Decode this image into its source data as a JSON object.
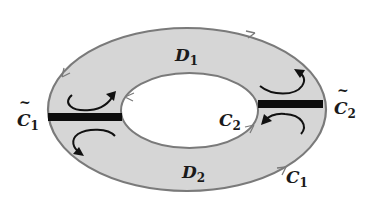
{
  "diagram": {
    "type": "annulus-region-decomposition",
    "colors": {
      "region_fill": "#d6d6d6",
      "boundary_stroke": "#7a7a7a",
      "cut_bar": "#0d0d0d",
      "arrow": "#111111",
      "background": "#ffffff"
    },
    "regions": [
      {
        "name": "D",
        "sub": "1",
        "position": "upper half of annulus"
      },
      {
        "name": "D",
        "sub": "2",
        "position": "lower half of annulus"
      }
    ],
    "curves": [
      {
        "name": "C",
        "sub": "1",
        "tilde": false,
        "role": "outer boundary"
      },
      {
        "name": "C",
        "sub": "2",
        "tilde": false,
        "role": "inner boundary"
      },
      {
        "name": "C",
        "sub": "1",
        "tilde": true,
        "role": "left cut"
      },
      {
        "name": "C",
        "sub": "2",
        "tilde": true,
        "role": "right cut"
      }
    ],
    "labels": {
      "d1": {
        "main": "D",
        "sub": "1"
      },
      "d2": {
        "main": "D",
        "sub": "2"
      },
      "c1": {
        "main": "C",
        "sub": "1"
      },
      "c2": {
        "main": "C",
        "sub": "2"
      },
      "c1_tilde": {
        "main": "C",
        "sub": "1",
        "accent": "~"
      },
      "c2_tilde": {
        "main": "C",
        "sub": "2",
        "accent": "~"
      }
    }
  }
}
